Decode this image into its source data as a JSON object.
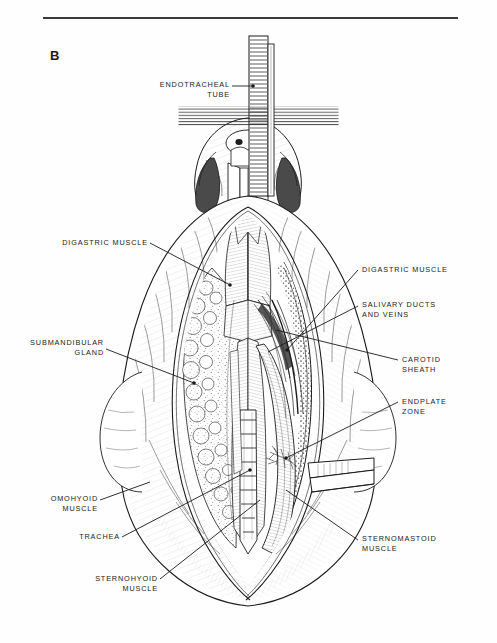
{
  "figure": {
    "panel_letter": "B",
    "domain_kind": "anatomical-line-illustration",
    "colors": {
      "ink": "#1b1b1b",
      "rule": "#3a3a3a",
      "paper": "#fefefe",
      "shadow": "#4a4a4a"
    }
  },
  "labels": {
    "endotracheal_tube": "ENDOTRACHEAL\nTUBE",
    "digastric_muscle_left": "DIGASTRIC MUSCLE",
    "digastric_muscle_right": "DIGASTRIC MUSCLE",
    "submandibular_gland": "SUBMANDIBULAR\nGLAND",
    "salivary_ducts_and_veins": "SALIVARY DUCTS\nAND VEINS",
    "carotid_sheath": "CAROTID\nSHEATH",
    "endplate_zone": "ENDPLATE\nZONE",
    "omohyoid_muscle": "OMOHYOID\nMUSCLE",
    "trachea": "TRACHEA",
    "sternohyoid_muscle": "STERNOHYOID\nMUSCLE",
    "sternomastoid_muscle": "STERNOMASTOID\nMUSCLE"
  }
}
